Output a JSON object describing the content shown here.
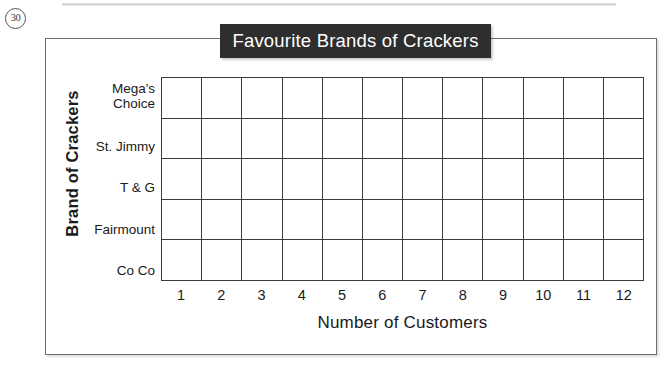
{
  "question_number": "30",
  "chart_data": {
    "type": "bar",
    "orientation": "horizontal",
    "title": "Favourite Brands of Crackers",
    "xlabel": "Number of Customers",
    "ylabel": "Brand of Crackers",
    "categories": [
      "Mega's Choice",
      "St. Jimmy",
      "T & G",
      "Fairmount",
      "Co Co"
    ],
    "values": [
      null,
      null,
      null,
      null,
      null
    ],
    "x_ticks": [
      "1",
      "2",
      "3",
      "4",
      "5",
      "6",
      "7",
      "8",
      "9",
      "10",
      "11",
      "12"
    ],
    "xlim": [
      0,
      12
    ],
    "grid": true,
    "legend": false,
    "note": "blank grid template — no bars drawn",
    "columns": 12,
    "rows": 5,
    "colors": {
      "title_background": "#2e2e2e",
      "title_text": "#ffffff",
      "grid_line": "#3b3b3b",
      "frame": "#6e6e6e",
      "page_background": "#ffffff"
    }
  }
}
